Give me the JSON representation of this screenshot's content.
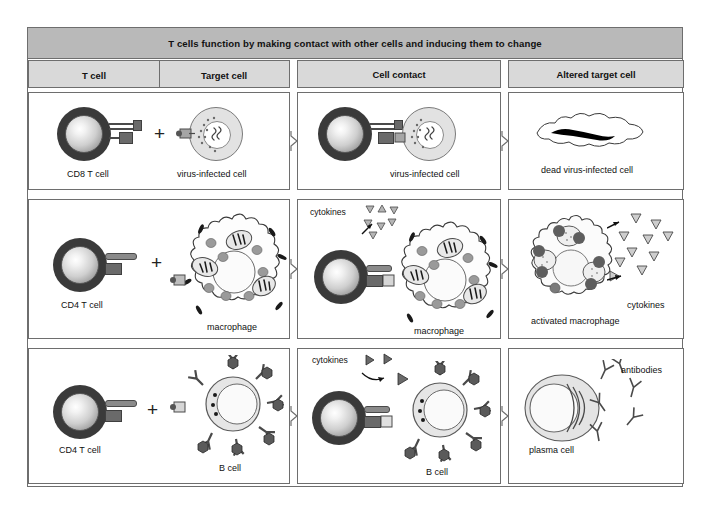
{
  "figure": {
    "title": "T cells function by making contact with other cells and inducing them to change",
    "columns": [
      {
        "key": "t_cell",
        "label": "T cell"
      },
      {
        "key": "target_cell",
        "label": "Target cell"
      },
      {
        "key": "cell_contact",
        "label": "Cell contact"
      },
      {
        "key": "altered_target_cell",
        "label": "Altered target cell"
      }
    ],
    "rows": [
      {
        "id": "row-cd8",
        "t_cell": "CD8 T cell",
        "target_cell": "virus-infected cell",
        "contact_target": "virus-infected cell",
        "altered": "dead virus-infected cell",
        "plus": "+"
      },
      {
        "id": "row-cd4-macrophage",
        "t_cell": "CD4 T cell",
        "target_cell": "macrophage",
        "contact_target": "macrophage",
        "contact_cytokines": "cytokines",
        "altered": "activated macrophage",
        "altered_cytokines": "cytokines",
        "plus": "+"
      },
      {
        "id": "row-cd4-bcell",
        "t_cell": "CD4 T cell",
        "target_cell": "B cell",
        "contact_target": "B cell",
        "contact_cytokines": "cytokines",
        "altered": "plasma cell",
        "altered_antibodies": "antibodies",
        "plus": "+"
      }
    ],
    "colors": {
      "title_band": "#b9b9b9",
      "column_header": "#d9d9d9",
      "border": "#6e6e6e",
      "t_cell_membrane": "#3a3a3a",
      "cytokine_fill": "#b0b0b0",
      "antigen_fill": "#555555",
      "dead_nucleus": "#000000",
      "page_background": "#ffffff"
    }
  }
}
